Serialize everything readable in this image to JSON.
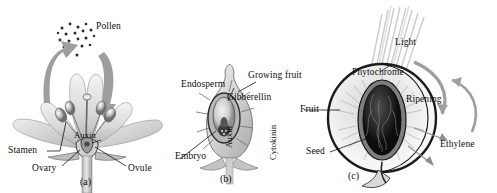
{
  "figure": {
    "type": "botanical-illustration",
    "background_color": "#ffffff",
    "ink_color": "#111111",
    "arrow_color": "#9b9b9b"
  },
  "panels": [
    {
      "id": "a",
      "marker": "(a)",
      "caption_subject": "flower-pollination",
      "labels": [
        {
          "name": "pollen",
          "text": "Pollen"
        },
        {
          "name": "stamen",
          "text": "Stamen"
        },
        {
          "name": "auxin",
          "text": "Auxin"
        },
        {
          "name": "ovary",
          "text": "Ovary"
        },
        {
          "name": "ovule",
          "text": "Ovule"
        }
      ]
    },
    {
      "id": "b",
      "marker": "(b)",
      "caption_subject": "growing-fruit-seed",
      "labels": [
        {
          "name": "growing-fruit",
          "text": "Growing fruit"
        },
        {
          "name": "endosperm",
          "text": "Endosperm"
        },
        {
          "name": "gibberellin",
          "text": "Gibberellin"
        },
        {
          "name": "auxin",
          "text": "Auxin"
        },
        {
          "name": "cytokinin",
          "text": "Cytokinin"
        },
        {
          "name": "embryo",
          "text": "Embryo"
        }
      ]
    },
    {
      "id": "c",
      "marker": "(c)",
      "caption_subject": "ripening-fruit",
      "labels": [
        {
          "name": "light",
          "text": "Light"
        },
        {
          "name": "phytochrome",
          "text": "Phytochrome"
        },
        {
          "name": "ripening",
          "text": "Ripening"
        },
        {
          "name": "fruit",
          "text": "Fruit"
        },
        {
          "name": "seed",
          "text": "Seed"
        },
        {
          "name": "ethylene",
          "text": "Ethylene"
        }
      ]
    }
  ]
}
